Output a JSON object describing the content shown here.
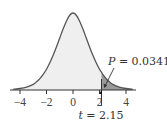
{
  "chart_data": {
    "type": "area",
    "title": "",
    "xlabel": "",
    "ylabel": "",
    "distribution": "t-distribution density curve",
    "xlim": [
      -4.7,
      4.7
    ],
    "xticks": [
      -4,
      -2,
      0,
      2,
      4
    ],
    "xtick_labels": [
      "−4",
      "−2",
      "0",
      "2",
      "4"
    ],
    "grid": false,
    "legend": null,
    "curve": {
      "x": [
        -4.5,
        -4.0,
        -3.5,
        -3.0,
        -2.75,
        -2.5,
        -2.25,
        -2.0,
        -1.75,
        -1.5,
        -1.25,
        -1.0,
        -0.75,
        -0.5,
        -0.25,
        0.0,
        0.25,
        0.5,
        0.75,
        1.0,
        1.25,
        1.5,
        1.75,
        2.0,
        2.15,
        2.25,
        2.5,
        2.75,
        3.0,
        3.5,
        4.0,
        4.5
      ],
      "density": [
        0.003,
        0.006,
        0.012,
        0.023,
        0.033,
        0.046,
        0.063,
        0.084,
        0.11,
        0.14,
        0.174,
        0.21,
        0.246,
        0.278,
        0.302,
        0.311,
        0.302,
        0.278,
        0.246,
        0.21,
        0.174,
        0.14,
        0.11,
        0.084,
        0.072,
        0.063,
        0.046,
        0.033,
        0.023,
        0.012,
        0.006,
        0.003
      ]
    },
    "critical_value": {
      "t": 2.15,
      "label": "t = 2.15"
    },
    "shaded_tail": {
      "from": 2.15,
      "to": 4.5,
      "p_value": 0.0341,
      "label": "P = 0.0341"
    },
    "colors": {
      "curve": "#555555",
      "body_fill": "#efefef",
      "tail_fill": "#9a9a9a",
      "axis": "#333333",
      "text": "#333333"
    }
  }
}
